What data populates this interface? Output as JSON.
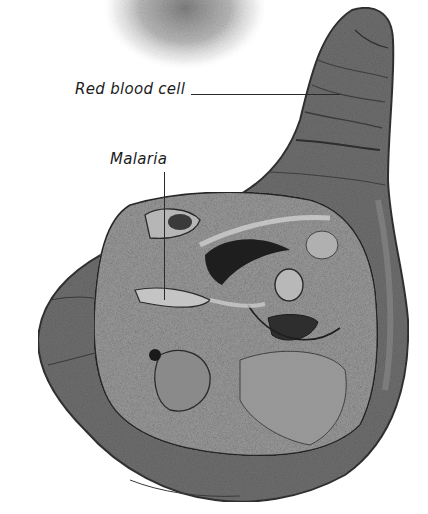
{
  "figure": {
    "type": "electron micrograph illustration (grayscale)",
    "labels": [
      {
        "id": "rbc",
        "text": "Red blood cell"
      },
      {
        "id": "malaria",
        "text": "Malaria"
      }
    ],
    "colors": {
      "background": "#ffffff",
      "cell_membrane": "#6e6e6e",
      "cell_outline": "#3a3a3a",
      "parasite_body": "#9a9a9a",
      "parasite_light": "#c8c8c8",
      "parasite_dark": "#2a2a2a",
      "label_text": "#1c1c1c",
      "blur_blob": "#8a8a8a"
    }
  }
}
